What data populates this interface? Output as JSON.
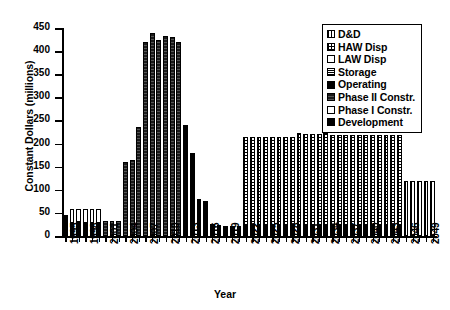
{
  "chart_data": {
    "type": "bar",
    "stacked": true,
    "title": "",
    "xlabel": "Year",
    "ylabel": "Constant Dollars (millions)",
    "ylim": [
      0,
      450
    ],
    "ytick_step": 50,
    "yticks": [
      0,
      50,
      100,
      150,
      200,
      250,
      300,
      350,
      400,
      450
    ],
    "xlim": [
      1995,
      2050
    ],
    "xtick_step": 3,
    "xticks": [
      "1995",
      "1998",
      "2001",
      "2004",
      "2007",
      "2010",
      "2013",
      "2016",
      "2019",
      "2022",
      "2025",
      "2028",
      "2031",
      "2034",
      "2037",
      "2040",
      "2043",
      "2046",
      "2049"
    ],
    "grid": false,
    "legend_position": "top-right",
    "legend": [
      "D&D",
      "HAW Disp",
      "LAW Disp",
      "Storage",
      "Operating",
      "Phase II Constr.",
      "Phase I Constr.",
      "Development"
    ],
    "categories": [
      "1995",
      "1996",
      "1997",
      "1998",
      "1999",
      "2000",
      "2001",
      "2002",
      "2003",
      "2004",
      "2005",
      "2006",
      "2007",
      "2008",
      "2009",
      "2010",
      "2011",
      "2012",
      "2013",
      "2014",
      "2015",
      "2016",
      "2017",
      "2018",
      "2019",
      "2020",
      "2021",
      "2022",
      "2023",
      "2024",
      "2025",
      "2026",
      "2027",
      "2028",
      "2029",
      "2030",
      "2031",
      "2032",
      "2033",
      "2034",
      "2035",
      "2036",
      "2037",
      "2038",
      "2039",
      "2040",
      "2041",
      "2042",
      "2043",
      "2044",
      "2045",
      "2046",
      "2047",
      "2048",
      "2049",
      "2050"
    ],
    "series": [
      {
        "name": "Development",
        "values": [
          45,
          28,
          30,
          28,
          28,
          28,
          0,
          0,
          0,
          0,
          0,
          0,
          0,
          0,
          0,
          0,
          0,
          0,
          0,
          0,
          0,
          0,
          0,
          0,
          0,
          0,
          0,
          0,
          0,
          0,
          0,
          0,
          0,
          0,
          0,
          0,
          0,
          0,
          0,
          0,
          0,
          0,
          0,
          0,
          0,
          0,
          0,
          0,
          0,
          0,
          0,
          0,
          0,
          0,
          0,
          0
        ]
      },
      {
        "name": "Phase I Constr.",
        "values": [
          0,
          30,
          28,
          30,
          30,
          30,
          0,
          0,
          0,
          0,
          0,
          0,
          0,
          0,
          0,
          0,
          0,
          0,
          0,
          0,
          0,
          0,
          0,
          0,
          0,
          0,
          0,
          0,
          0,
          0,
          0,
          0,
          0,
          0,
          0,
          0,
          0,
          0,
          0,
          0,
          0,
          0,
          0,
          0,
          0,
          0,
          0,
          0,
          0,
          0,
          0,
          0,
          0,
          0,
          0,
          0
        ]
      },
      {
        "name": "Phase II Constr.",
        "values": [
          0,
          0,
          0,
          0,
          0,
          0,
          32,
          32,
          32,
          160,
          165,
          235,
          420,
          440,
          425,
          432,
          430,
          420,
          0,
          0,
          0,
          0,
          0,
          0,
          0,
          0,
          0,
          0,
          0,
          0,
          0,
          0,
          0,
          0,
          0,
          0,
          0,
          0,
          0,
          0,
          0,
          0,
          0,
          0,
          0,
          0,
          0,
          0,
          0,
          0,
          0,
          0,
          0,
          0,
          0,
          0
        ]
      },
      {
        "name": "Operating",
        "values": [
          0,
          0,
          0,
          0,
          0,
          0,
          0,
          0,
          0,
          0,
          0,
          0,
          0,
          0,
          0,
          0,
          0,
          0,
          240,
          180,
          80,
          75,
          25,
          23,
          22,
          22,
          22,
          22,
          22,
          22,
          22,
          22,
          22,
          22,
          22,
          22,
          22,
          22,
          22,
          22,
          22,
          22,
          22,
          22,
          22,
          22,
          22,
          22,
          22,
          22,
          22,
          0,
          0,
          0,
          0,
          0
        ]
      },
      {
        "name": "Storage",
        "values": [
          0,
          0,
          0,
          0,
          0,
          0,
          0,
          0,
          0,
          0,
          0,
          0,
          0,
          0,
          0,
          0,
          0,
          0,
          0,
          0,
          0,
          0,
          0,
          0,
          0,
          0,
          0,
          0,
          0,
          0,
          0,
          0,
          0,
          0,
          0,
          0,
          0,
          0,
          0,
          0,
          0,
          0,
          0,
          0,
          0,
          0,
          0,
          0,
          0,
          0,
          0,
          0,
          0,
          0,
          0,
          0
        ]
      },
      {
        "name": "LAW Disp",
        "values": [
          0,
          0,
          0,
          0,
          0,
          0,
          0,
          0,
          0,
          0,
          0,
          0,
          0,
          0,
          0,
          0,
          0,
          0,
          0,
          0,
          0,
          0,
          0,
          0,
          0,
          0,
          0,
          0,
          0,
          0,
          0,
          0,
          0,
          0,
          0,
          0,
          0,
          0,
          0,
          0,
          0,
          0,
          0,
          0,
          0,
          0,
          0,
          0,
          0,
          0,
          0,
          0,
          0,
          0,
          0,
          0
        ]
      },
      {
        "name": "HAW Disp",
        "values": [
          0,
          0,
          0,
          0,
          0,
          0,
          0,
          0,
          0,
          0,
          0,
          0,
          0,
          0,
          0,
          0,
          0,
          0,
          0,
          0,
          0,
          0,
          0,
          0,
          0,
          0,
          0,
          193,
          193,
          193,
          193,
          193,
          193,
          193,
          193,
          200,
          198,
          198,
          198,
          200,
          196,
          196,
          196,
          196,
          196,
          196,
          196,
          196,
          196,
          196,
          196,
          0,
          0,
          0,
          0,
          0
        ]
      },
      {
        "name": "D&D",
        "values": [
          0,
          0,
          0,
          0,
          0,
          0,
          0,
          0,
          0,
          0,
          0,
          0,
          0,
          0,
          0,
          0,
          0,
          0,
          0,
          0,
          0,
          0,
          0,
          0,
          0,
          0,
          0,
          0,
          0,
          0,
          0,
          0,
          0,
          0,
          0,
          0,
          0,
          0,
          0,
          0,
          0,
          0,
          0,
          0,
          0,
          0,
          0,
          0,
          0,
          0,
          0,
          120,
          120,
          120,
          120,
          120
        ]
      }
    ],
    "totals": [
      45,
      58,
      58,
      58,
      58,
      58,
      32,
      32,
      32,
      160,
      165,
      235,
      420,
      440,
      425,
      432,
      430,
      420,
      240,
      180,
      80,
      75,
      25,
      23,
      22,
      22,
      22,
      215,
      215,
      215,
      215,
      215,
      215,
      215,
      215,
      222,
      220,
      220,
      220,
      222,
      218,
      218,
      218,
      218,
      218,
      218,
      218,
      218,
      218,
      218,
      218,
      120,
      120,
      120,
      120,
      120
    ]
  }
}
